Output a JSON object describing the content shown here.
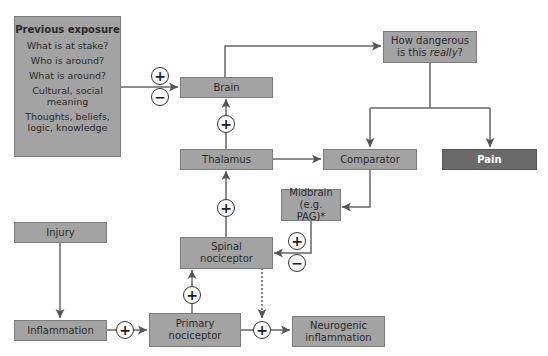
{
  "diagram": {
    "type": "pain-modulation-flowchart",
    "nodes": {
      "previous_exposure": {
        "title": "Previous exposure",
        "lines": [
          "What is at stake?",
          "Who is around?",
          "What is around?",
          "Cultural, social meaning",
          "Thoughts, beliefs, logic, knowledge"
        ]
      },
      "brain": {
        "label": "Brain"
      },
      "how_dangerous": {
        "label_pre": "How dangerous is this ",
        "label_em": "really",
        "label_post": "?"
      },
      "thalamus": {
        "label": "Thalamus"
      },
      "comparator": {
        "label": "Comparator"
      },
      "pain": {
        "label": "Pain"
      },
      "midbrain": {
        "label": "Midbrain (e.g. PAG)*"
      },
      "spinal_nociceptor": {
        "label": "Spinal nociceptor"
      },
      "injury": {
        "label": "Injury"
      },
      "inflammation": {
        "label": "Inflammation"
      },
      "primary_nociceptor": {
        "label": "Primary nociceptor"
      },
      "neurogenic_inflammation": {
        "label": "Neurogenic inflammation"
      }
    },
    "signs": {
      "plus": "+",
      "minus": "−"
    },
    "edges": [
      {
        "from": "previous_exposure",
        "to": "brain",
        "sign": "+/−"
      },
      {
        "from": "thalamus",
        "to": "brain",
        "sign": "+"
      },
      {
        "from": "brain",
        "to": "how_dangerous"
      },
      {
        "from": "how_dangerous",
        "to": "comparator"
      },
      {
        "from": "how_dangerous",
        "to": "pain"
      },
      {
        "from": "thalamus",
        "to": "comparator"
      },
      {
        "from": "comparator",
        "to": "midbrain"
      },
      {
        "from": "midbrain",
        "to": "spinal_nociceptor",
        "sign": "+/−"
      },
      {
        "from": "spinal_nociceptor",
        "to": "thalamus",
        "sign": "+"
      },
      {
        "from": "primary_nociceptor",
        "to": "spinal_nociceptor",
        "sign": "+"
      },
      {
        "from": "injury",
        "to": "inflammation"
      },
      {
        "from": "inflammation",
        "to": "primary_nociceptor",
        "sign": "+"
      },
      {
        "from": "primary_nociceptor",
        "to": "neurogenic_inflammation",
        "sign": "+"
      },
      {
        "from": "spinal_nociceptor",
        "to": "neurogenic_inflammation",
        "style": "dotted"
      }
    ],
    "colors": {
      "box_fill": "#a3a3a3",
      "box_border": "#7c7c7c",
      "pain_fill": "#6a6a6a",
      "line": "#555555"
    }
  }
}
